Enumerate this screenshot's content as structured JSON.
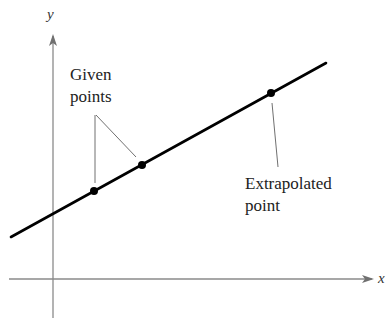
{
  "diagram": {
    "type": "linear-extrapolation",
    "axes": {
      "x_label": "x",
      "y_label": "y"
    },
    "line": {
      "color": "#000000",
      "start": [
        11,
        237
      ],
      "end": [
        326,
        63
      ]
    },
    "points": [
      {
        "role": "given",
        "px": [
          94,
          191
        ]
      },
      {
        "role": "given",
        "px": [
          142,
          165
        ]
      },
      {
        "role": "extrapolated",
        "px": [
          271,
          93
        ]
      }
    ],
    "annotations": {
      "given_line1": "Given",
      "given_line2": "points",
      "extrap_line1": "Extrapolated",
      "extrap_line2": "point"
    },
    "colors": {
      "axis": "#808080",
      "line": "#000000",
      "leader": "#707070",
      "text": "#222222"
    }
  }
}
